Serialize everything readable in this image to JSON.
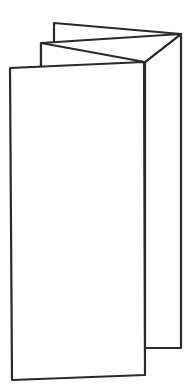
{
  "figure": {
    "panel_count": 4,
    "stroke_color": "#2a2a2a",
    "fill_color": "#ffffff",
    "background": "#ffffff"
  }
}
